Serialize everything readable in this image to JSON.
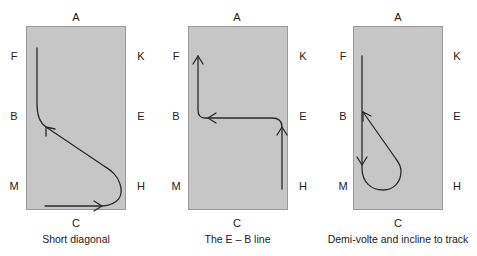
{
  "colors": {
    "arena_fill": "#c6c6c6",
    "arena_border": "#9a9a9a",
    "path_stroke": "#2a2a2a",
    "background": "#ffffff"
  },
  "panels": [
    {
      "markers": {
        "top": "A",
        "left_upper": "F",
        "left_middle": "B",
        "left_lower": "M",
        "right_upper": "K",
        "right_middle": "E",
        "right_lower": "H",
        "bottom": "C"
      },
      "caption": "Short diagonal"
    },
    {
      "markers": {
        "top": "A",
        "left_upper": "F",
        "left_middle": "B",
        "left_lower": "M",
        "right_upper": "K",
        "right_middle": "E",
        "right_lower": "H",
        "bottom": "C"
      },
      "caption": "The E – B line"
    },
    {
      "markers": {
        "top": "A",
        "left_upper": "F",
        "left_middle": "B",
        "left_lower": "M",
        "right_upper": "K",
        "right_middle": "E",
        "right_lower": "H",
        "bottom": "C"
      },
      "caption": "Demi-volte and incline to track"
    }
  ]
}
